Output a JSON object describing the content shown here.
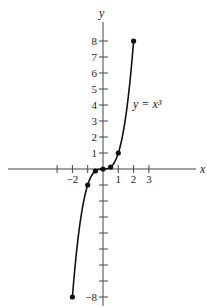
{
  "chart_data": {
    "type": "line",
    "title": "",
    "xlabel": "x",
    "ylabel": "y",
    "annotation": "y = x³",
    "function": "y = x^3",
    "xlim": [
      -2,
      2
    ],
    "ylim": [
      -8,
      8
    ],
    "x_ticks": [
      -3,
      -2,
      -1,
      0,
      1,
      2,
      3
    ],
    "x_tick_labels": [
      {
        "value": -2,
        "label": "−2"
      },
      {
        "value": 1,
        "label": "1"
      },
      {
        "value": 2,
        "label": "2"
      },
      {
        "value": 3,
        "label": "3"
      }
    ],
    "y_ticks": [
      -8,
      -7,
      -6,
      -5,
      -4,
      -3,
      -2,
      -1,
      1,
      2,
      3,
      4,
      5,
      6,
      7,
      8
    ],
    "y_tick_labels": [
      {
        "value": 8,
        "label": "8"
      },
      {
        "value": 7,
        "label": "7"
      },
      {
        "value": 6,
        "label": "6"
      },
      {
        "value": 5,
        "label": "5"
      },
      {
        "value": 4,
        "label": "4"
      },
      {
        "value": 3,
        "label": "3"
      },
      {
        "value": 2,
        "label": "2"
      },
      {
        "value": 1,
        "label": "1"
      },
      {
        "value": -8,
        "label": "−8"
      }
    ],
    "points": [
      {
        "x": -2,
        "y": -8
      },
      {
        "x": -1,
        "y": -1
      },
      {
        "x": -0.5,
        "y": -0.125
      },
      {
        "x": 0,
        "y": 0
      },
      {
        "x": 0.5,
        "y": 0.125
      },
      {
        "x": 1,
        "y": 1
      },
      {
        "x": 2,
        "y": 8
      }
    ],
    "grid": false,
    "legend": null
  },
  "colors": {
    "curve": "#111111",
    "axis": "#444444",
    "text": "#222222"
  }
}
